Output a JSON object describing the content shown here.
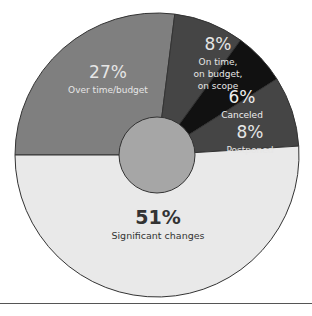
{
  "chart_data": {
    "type": "pie",
    "variant": "donut",
    "title": "",
    "start_angle": "9 o'clock, clockwise",
    "slices": [
      {
        "label": "Over time/budget",
        "value": 27,
        "display": "27%",
        "color": "#7f7f7f",
        "text_color": "#e6e6e6"
      },
      {
        "label": "On time, on budget, on scope",
        "lines": [
          "On time,",
          "on budget,",
          "on scope"
        ],
        "value": 8,
        "display": "8%",
        "color": "#454545",
        "text_color": "#e6e6e6"
      },
      {
        "label": "Canceled",
        "value": 6,
        "display": "6%",
        "color": "#111111",
        "text_color": "#eeeeee"
      },
      {
        "label": "Postponed",
        "value": 8,
        "display": "8%",
        "color": "#454545",
        "text_color": "#e6e6e6"
      },
      {
        "label": "Significant changes",
        "value": 51,
        "display": "51%",
        "color": "#e9e9e9",
        "text_color": "#333333"
      }
    ],
    "center_circle_color": "#a6a6a6",
    "outline_color": "#333333"
  }
}
